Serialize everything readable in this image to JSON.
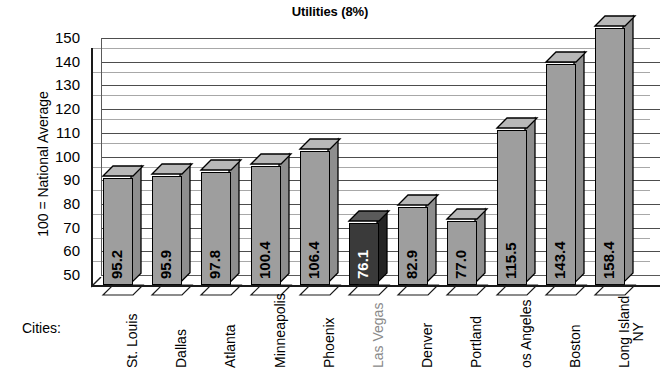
{
  "chart_data": {
    "type": "bar",
    "title": "Utilities (8%)",
    "xlabel": "Cities:",
    "ylabel": "100 = National Average",
    "categories": [
      "St. Louis",
      "Dallas",
      "Atlanta",
      "Minneapolis",
      "Phoenix",
      "Las Vegas",
      "Denver",
      "Portland",
      "Los Angeles",
      "Boston",
      "Long Island NY"
    ],
    "category_display": [
      "St. Louis",
      "Dallas",
      "Atlanta",
      "Minneapolis",
      "Phoenix",
      "Las Vegas",
      "Denver",
      "Portland",
      "os Angeles",
      "Boston",
      "Long Island\nNY"
    ],
    "values": [
      95.2,
      95.9,
      97.8,
      100.4,
      106.4,
      76.1,
      82.9,
      77.0,
      115.5,
      143.4,
      158.4
    ],
    "value_labels": [
      "95.2",
      "95.9",
      "97.8",
      "100.4",
      "106.4",
      "76.1",
      "82.9",
      "77.0",
      "115.5",
      "143.4",
      "158.4"
    ],
    "highlighted_index": 5,
    "ylim": [
      50,
      150
    ],
    "ytick_labels": [
      "150",
      "140",
      "130",
      "120",
      "110",
      "100",
      "90",
      "80",
      "70",
      "60",
      "50"
    ],
    "ytick_values": [
      150,
      140,
      130,
      120,
      110,
      100,
      90,
      80,
      70,
      60,
      50
    ],
    "grid": true,
    "legend": "none",
    "colors": {
      "bar_fill": "#9e9e9e",
      "bar_fill_highlight": "#3a3a3a",
      "bar_top": "#b8b8b8",
      "bar_side": "#8e8e8e",
      "outline": "#000000",
      "gridline": "#4d4d4d",
      "highlight_label": "#8a8a8a",
      "background": "#ffffff"
    }
  }
}
